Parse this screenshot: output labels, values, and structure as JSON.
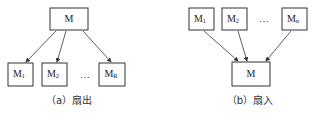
{
  "fan_out": {
    "parent": {
      "main": "M",
      "sub": ""
    },
    "children": [
      {
        "main": "M",
        "sub": "1"
      },
      {
        "main": "M",
        "sub": "2"
      },
      {
        "main": "M",
        "sub": "R"
      }
    ],
    "ellipsis": "…",
    "caption": "（a）扇出"
  },
  "fan_in": {
    "child": {
      "main": "M",
      "sub": ""
    },
    "parents": [
      {
        "main": "M",
        "sub": "1"
      },
      {
        "main": "M",
        "sub": "2"
      },
      {
        "main": "M",
        "sub": "n"
      }
    ],
    "ellipsis": "…",
    "caption": "（b）扇入"
  }
}
